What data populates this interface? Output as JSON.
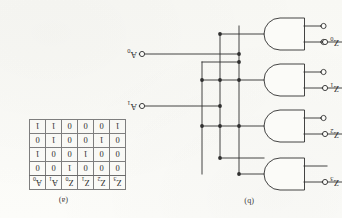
{
  "figure": {
    "caption_table": "(a)",
    "caption_circuit": "(b)"
  },
  "truth_table": {
    "input_headers": [
      "Z3",
      "Z2",
      "Z1",
      "Z0"
    ],
    "output_headers": [
      "A1",
      "A0"
    ],
    "input_headers_display": [
      "Z",
      "Z",
      "Z",
      "Z"
    ],
    "input_subs": [
      "3",
      "2",
      "1",
      "0"
    ],
    "output_headers_display": [
      "A",
      "A"
    ],
    "output_subs": [
      "1",
      "0"
    ],
    "rows": [
      {
        "inputs": [
          "0",
          "0",
          "0",
          "1"
        ],
        "outputs": [
          "0",
          "0"
        ]
      },
      {
        "inputs": [
          "0",
          "0",
          "1",
          "0"
        ],
        "outputs": [
          "0",
          "1"
        ]
      },
      {
        "inputs": [
          "0",
          "1",
          "0",
          "0"
        ],
        "outputs": [
          "1",
          "0"
        ]
      },
      {
        "inputs": [
          "1",
          "0",
          "0",
          "0"
        ],
        "outputs": [
          "1",
          "1"
        ]
      }
    ]
  },
  "circuit": {
    "input_labels": [
      {
        "name": "Z",
        "sub": "3"
      },
      {
        "name": "Z",
        "sub": "2"
      },
      {
        "name": "Z",
        "sub": "1"
      },
      {
        "name": "Z",
        "sub": "0"
      }
    ],
    "output_labels": [
      {
        "name": "A",
        "sub": "1"
      },
      {
        "name": "A",
        "sub": "0"
      }
    ],
    "gates": [
      {
        "id": "gate-1",
        "type": "and",
        "bubbles": 0
      },
      {
        "id": "gate-2",
        "type": "and",
        "bubbles": 1
      },
      {
        "id": "gate-3",
        "type": "and",
        "bubbles": 1
      },
      {
        "id": "gate-4",
        "type": "and",
        "bubbles": 2
      }
    ],
    "colors": {
      "ink": "#2f2f2f",
      "paper": "#fbfbf8"
    }
  }
}
